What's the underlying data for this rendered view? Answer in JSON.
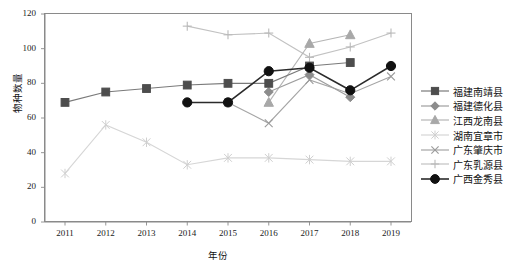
{
  "chart_data": {
    "type": "line",
    "title": "",
    "xlabel": "年份",
    "ylabel": "物种数量",
    "grid": false,
    "legend_position": "right",
    "x": [
      2011,
      2012,
      2013,
      2014,
      2015,
      2016,
      2017,
      2018,
      2019
    ],
    "xtick_labels": [
      "2011",
      "2012",
      "2013",
      "2014",
      "2015",
      "2016",
      "2017",
      "2018",
      "2019"
    ],
    "ytick_labels": [
      "0",
      "20",
      "40",
      "60",
      "80",
      "100",
      "120"
    ],
    "ylim": [
      0,
      120
    ],
    "yticks": [
      0,
      20,
      40,
      60,
      80,
      100,
      120
    ],
    "series": [
      {
        "name": "福建南靖县",
        "marker": "square",
        "color": "#4d4d4d",
        "line_color": "#7a7a7a",
        "x": [
          2011,
          2012,
          2013,
          2014,
          2015,
          2016,
          2017,
          2018
        ],
        "values": [
          69,
          75,
          77,
          79,
          80,
          80,
          90,
          92
        ]
      },
      {
        "name": "福建德化县",
        "marker": "diamond",
        "color": "#8c8c8c",
        "line_color": "#9e9e9e",
        "x": [
          2016,
          2017,
          2018
        ],
        "values": [
          75,
          85,
          72
        ]
      },
      {
        "name": "江西龙南县",
        "marker": "triangle",
        "color": "#a8a8a8",
        "line_color": "#b5b5b5",
        "x": [
          2016,
          2017,
          2018
        ],
        "values": [
          69,
          103,
          108
        ]
      },
      {
        "name": "湖南宜章市",
        "marker": "star",
        "color": "#cfcfcf",
        "line_color": "#d6d6d6",
        "x": [
          2011,
          2012,
          2013,
          2014,
          2015,
          2016,
          2017,
          2018,
          2019
        ],
        "values": [
          28,
          56,
          46,
          33,
          37,
          37,
          36,
          35,
          35
        ]
      },
      {
        "name": "广东肇庆市",
        "marker": "cross",
        "color": "#9a9a9a",
        "line_color": "#a5a5a5",
        "x": [
          2015,
          2016,
          2017,
          2018,
          2019
        ],
        "values": [
          69,
          57,
          82,
          74,
          84
        ]
      },
      {
        "name": "广东乳源县",
        "marker": "plus",
        "color": "#b9b9b9",
        "line_color": "#c2c2c2",
        "x": [
          2014,
          2015,
          2016,
          2017,
          2018,
          2019
        ],
        "values": [
          113,
          108,
          109,
          95,
          101,
          109
        ]
      },
      {
        "name": "广西金秀县",
        "marker": "circle",
        "color": "#111111",
        "line_color": "#2b2b2b",
        "x": [
          2014,
          2015,
          2016,
          2017,
          2018,
          2019
        ],
        "values": [
          69,
          69,
          87,
          89,
          76,
          90
        ]
      }
    ]
  }
}
